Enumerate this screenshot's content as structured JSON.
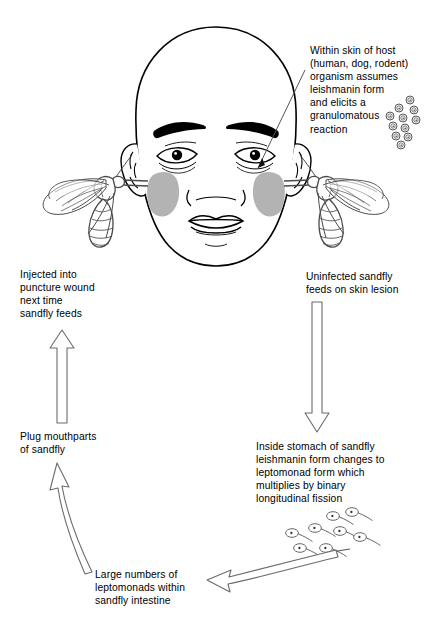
{
  "diagram": {
    "colors": {
      "ink": "#000000",
      "outline": "#3a3a3a",
      "lesion": "#b3b3b3",
      "wing": "#8a8a8a",
      "background": "#ffffff"
    }
  },
  "captions": {
    "host": "Within skin of host\n(human, dog, rodent)\norganism assumes\nleishmanin form\nand elicits a\ngranulomatous\nreaction",
    "uninfected": "Uninfected sandfly\nfeeds on skin lesion",
    "stomach": "Inside stomach of sandfly\nleishmanin form changes to\nleptomonad form which\nmultiplies by binary\nlongitudinal fission",
    "large_numbers": "Large numbers of\nleptomonads within\nsandfly intestine",
    "plug": "Plug mouthparts\nof sandfly",
    "injected": "Injected into\npuncture wound\nnext time\nsandfly feeds"
  },
  "figures": {
    "head_label": "human head front view",
    "lesion_left_label": "skin lesion left cheek",
    "lesion_right_label": "skin lesion right cheek",
    "sandfly_left_label": "sandfly feeding on left cheek",
    "sandfly_right_label": "sandfly feeding on right cheek",
    "amastigotes_label": "leishmanial amastigote cluster",
    "promastigotes_label": "leptomonad promastigote cluster"
  },
  "arrows": {
    "down_right_label": "arrow head to sandfly stomach",
    "left_bottom_label": "arrow stomach to intestine",
    "up_curved_label": "arrow intestine to mouthparts",
    "up_straight_label": "arrow mouthparts to injection",
    "leader_label": "leader line to skin lesion"
  }
}
